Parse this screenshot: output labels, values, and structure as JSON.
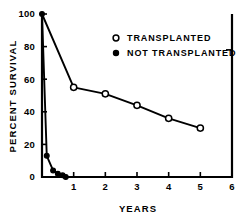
{
  "chart_data": {
    "type": "line",
    "title": "",
    "xlabel": "YEARS",
    "ylabel": "PERCENT SURVIVAL",
    "xlim": [
      0,
      6
    ],
    "ylim": [
      0,
      100
    ],
    "xticks": [
      "1",
      "2",
      "3",
      "4",
      "5",
      "6"
    ],
    "xtick_values": [
      1,
      2,
      3,
      4,
      5,
      6
    ],
    "yticks": [
      "0",
      "20",
      "40",
      "60",
      "80",
      "100"
    ],
    "ytick_values": [
      0,
      20,
      40,
      60,
      80,
      100
    ],
    "grid": false,
    "legend_position": "upper right",
    "series": [
      {
        "name": "TRANSPLANTED",
        "marker": "open-circle",
        "x": [
          0,
          1,
          2,
          3,
          4,
          5
        ],
        "values": [
          100,
          55,
          51,
          44,
          36,
          30
        ]
      },
      {
        "name": "NOT TRANSPLANTED",
        "marker": "filled-circle",
        "x": [
          0,
          0.15,
          0.35,
          0.5,
          0.65,
          0.75
        ],
        "values": [
          100,
          13,
          4,
          2,
          1,
          0
        ]
      }
    ]
  },
  "legend": {
    "entries": [
      {
        "label": "TRANSPLANTED",
        "marker": "open-circle"
      },
      {
        "label": "NOT TRANSPLANTED",
        "marker": "filled-circle"
      }
    ]
  },
  "colors": {
    "ink": "#000000",
    "background": "#ffffff"
  }
}
